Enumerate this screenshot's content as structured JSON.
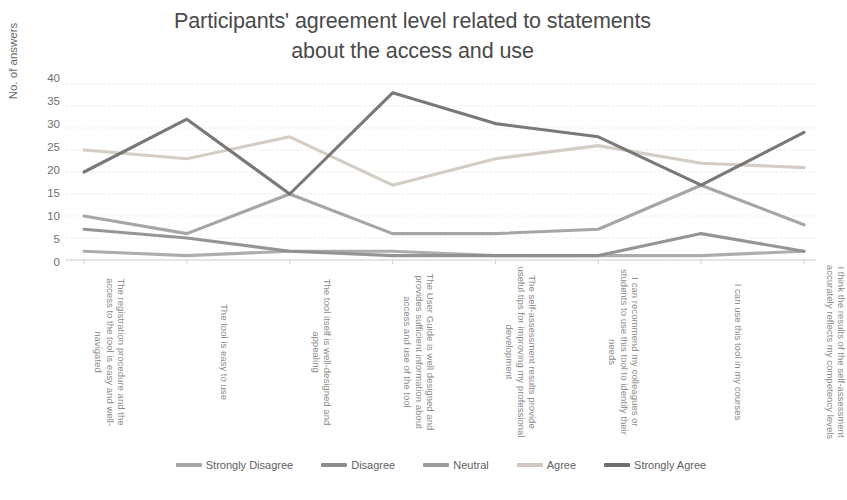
{
  "chart_data": {
    "type": "line",
    "title": "Participants' agreement level related to statements about the access and use",
    "title_lines": [
      "Participants' agreement level related to statements",
      "about the access and use"
    ],
    "xlabel": "",
    "ylabel": "No. of answers",
    "ylim": [
      0,
      40
    ],
    "ytick_step": 5,
    "yticks": [
      40,
      35,
      30,
      25,
      20,
      15,
      10,
      5,
      0
    ],
    "grid": true,
    "legend_position": "bottom",
    "categories": [
      "The registration procedure and the access to the tool is easy and well-navigated",
      "The tool is easy to use",
      "The tool itself is well-designed and appealing",
      "The User Guide is well designed and provides sufficient information about access and use of the tool",
      "The self-assessment results provide useful tips for improving my professional development",
      "I can recommend my colleagues or students to use this tool to identify their needs",
      "I can use this tool in my courses",
      "I think the results of the self-assessment accurately reflects my competency levels"
    ],
    "series": [
      {
        "name": "Strongly Disagree",
        "color": "#a6a6a6",
        "values": [
          2,
          1,
          2,
          2,
          1,
          1,
          1,
          2
        ]
      },
      {
        "name": "Disagree",
        "color": "#8c8c8c",
        "values": [
          7,
          5,
          2,
          1,
          1,
          1,
          6,
          2
        ]
      },
      {
        "name": "Neutral",
        "color": "#9e9e9e",
        "values": [
          10,
          6,
          15,
          6,
          6,
          7,
          17,
          8
        ]
      },
      {
        "name": "Agree",
        "color": "#cfc9bd",
        "values": [
          25,
          23,
          28,
          17,
          23,
          26,
          22,
          21
        ]
      },
      {
        "name": "Strongly Agree",
        "color": "#6e6e6e",
        "values": [
          20,
          32,
          15,
          38,
          31,
          28,
          17,
          29
        ]
      }
    ]
  },
  "caption": {
    "prefix": "",
    "text": ""
  }
}
